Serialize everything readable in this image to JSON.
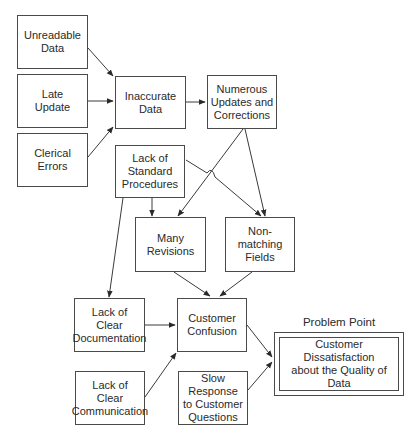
{
  "diagram": {
    "type": "cause-and-effect flow",
    "nodes": {
      "unreadable": "Unreadable\nData",
      "late": "Late\nUpdate",
      "clerical": "Clerical\nErrors",
      "inaccurate": "Inaccurate\nData",
      "numerous": "Numerous\nUpdates and\nCorrections",
      "standard": "Lack of\nStandard\nProcedures",
      "revisions": "Many\nRevisions",
      "nonmatching": "Non-matching\nFields",
      "documentation": "Lack of\nClear\nDocumentation",
      "confusion": "Customer\nConfusion",
      "communication": "Lack of\nClear\nCommunication",
      "slow": "Slow Response\nto Customer\nQuestions",
      "problem": "Customer Dissatisfaction\nabout the Quality of Data"
    },
    "problem_label": "Problem Point",
    "edges": [
      [
        "unreadable",
        "inaccurate"
      ],
      [
        "late",
        "inaccurate"
      ],
      [
        "clerical",
        "inaccurate"
      ],
      [
        "inaccurate",
        "numerous"
      ],
      [
        "numerous",
        "revisions"
      ],
      [
        "numerous",
        "nonmatching"
      ],
      [
        "standard",
        "revisions"
      ],
      [
        "standard",
        "nonmatching"
      ],
      [
        "standard",
        "documentation"
      ],
      [
        "revisions",
        "confusion"
      ],
      [
        "nonmatching",
        "confusion"
      ],
      [
        "documentation",
        "confusion"
      ],
      [
        "communication",
        "confusion"
      ],
      [
        "confusion",
        "problem"
      ],
      [
        "slow",
        "problem"
      ]
    ]
  }
}
